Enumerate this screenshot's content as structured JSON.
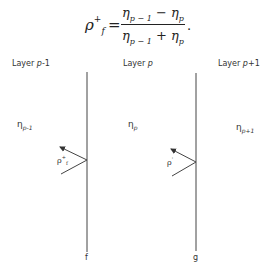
{
  "equation": {
    "lhs_symbol": "ρ",
    "lhs_superscript": "+",
    "lhs_subscript": "f",
    "equals": "=",
    "numerator": {
      "a": "η",
      "a_sub": "p − 1",
      "op": " − ",
      "b": "η",
      "b_sub": "p"
    },
    "denominator": {
      "a": "η",
      "a_sub": "p − 1",
      "op": " + ",
      "b": "η",
      "b_sub": "p"
    },
    "trailing": "."
  },
  "layers": [
    {
      "label_prefix": "Layer ",
      "label_var": "p",
      "label_suffix": "-1",
      "eta_symbol": "η",
      "eta_sub": "p-1"
    },
    {
      "label_prefix": "Layer ",
      "label_var": "p",
      "label_suffix": "",
      "eta_symbol": "η",
      "eta_sub": "p"
    },
    {
      "label_prefix": "Layer ",
      "label_var": "p",
      "label_suffix": "+1",
      "eta_symbol": "η",
      "eta_sub": "p+1"
    }
  ],
  "interfaces": [
    {
      "label": "f",
      "reflection_symbol": "ρ",
      "reflection_sup": "+",
      "reflection_sub": "f"
    },
    {
      "label": "g",
      "reflection_symbol": "ρ",
      "reflection_sup": "'",
      "reflection_sub": ""
    }
  ]
}
